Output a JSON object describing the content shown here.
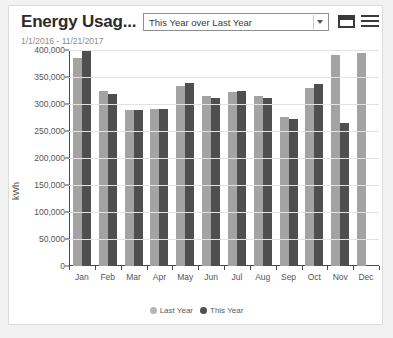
{
  "header": {
    "title": "Energy Usag...",
    "date_range": "1/1/2016 - 11/21/2017",
    "dropdown": {
      "selected": "This Year over Last Year",
      "options": [
        "This Year over Last Year"
      ]
    },
    "icons": {
      "window": "window-icon",
      "menu": "hamburger-menu-icon",
      "caret": "chevron-down-icon"
    }
  },
  "chart_data": {
    "type": "bar",
    "title": "Energy Usag...",
    "subtitle": "1/1/2016 - 11/21/2017",
    "xlabel": "",
    "ylabel": "kWh",
    "ylim": [
      0,
      400000
    ],
    "ytick_labels": [
      "400,000",
      "350,000",
      "300,000",
      "250,000",
      "200,000",
      "150,000",
      "100,000",
      "50,000",
      "0"
    ],
    "ytick_values": [
      400000,
      350000,
      300000,
      250000,
      200000,
      150000,
      100000,
      50000,
      0
    ],
    "grid": true,
    "legend_position": "bottom",
    "categories": [
      "Jan",
      "Feb",
      "Mar",
      "Apr",
      "May",
      "Jun",
      "Jul",
      "Aug",
      "Sep",
      "Oct",
      "Nov",
      "Dec"
    ],
    "series": [
      {
        "name": "Last Year",
        "color": "#a3a3a3",
        "values": [
          385000,
          325000,
          288000,
          290000,
          333000,
          315000,
          322000,
          315000,
          276000,
          330000,
          390000,
          395000
        ]
      },
      {
        "name": "This Year",
        "color": "#4f4f4f",
        "values": [
          400000,
          318000,
          288000,
          291000,
          338000,
          312000,
          325000,
          312000,
          272000,
          337000,
          265000,
          null
        ]
      }
    ]
  },
  "legend": [
    {
      "label": "Last Year",
      "marker": "circle",
      "color": "#b5b5b5"
    },
    {
      "label": "This Year",
      "marker": "circle",
      "color": "#4f4f4f"
    }
  ]
}
